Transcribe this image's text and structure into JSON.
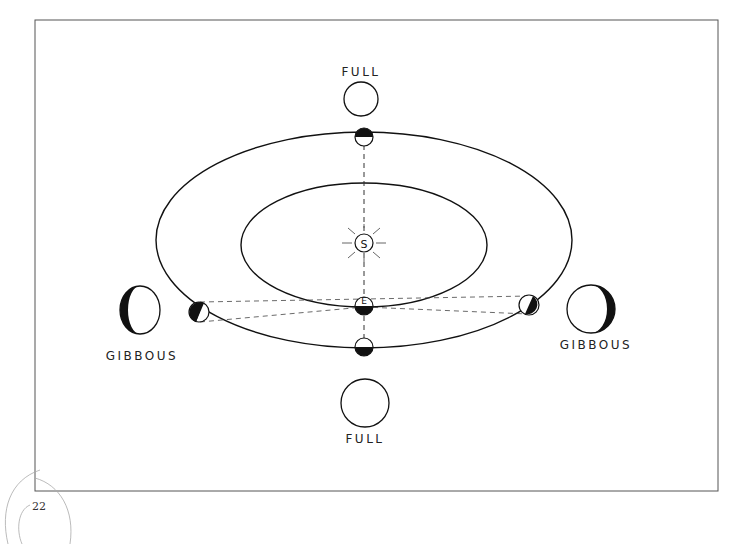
{
  "diagram": {
    "sun_label": "S",
    "earth_label": "E",
    "labels": {
      "top_phase": "FULL",
      "bottom_phase": "FULL",
      "left_phase": "GIBBOUS",
      "right_phase": "GIBBOUS"
    },
    "colors": {
      "ink": "#111111",
      "frame": "#555555",
      "paper": "#ffffff"
    }
  },
  "page": {
    "number": "22"
  }
}
